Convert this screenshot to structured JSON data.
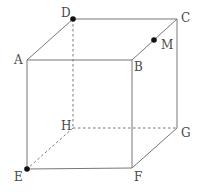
{
  "diagram": {
    "vertices": {
      "A": {
        "label": "A",
        "x": 27,
        "y": 60,
        "label_x": 14,
        "label_y": 64
      },
      "B": {
        "label": "B",
        "x": 132,
        "y": 60,
        "label_x": 134,
        "label_y": 71
      },
      "C": {
        "label": "C",
        "x": 177,
        "y": 19,
        "label_x": 181,
        "label_y": 22
      },
      "D": {
        "label": "D",
        "x": 73,
        "y": 19,
        "label_x": 61,
        "label_y": 17
      },
      "E": {
        "label": "E",
        "x": 27,
        "y": 169,
        "label_x": 14,
        "label_y": 181
      },
      "F": {
        "label": "F",
        "x": 132,
        "y": 168,
        "label_x": 134,
        "label_y": 181
      },
      "G": {
        "label": "G",
        "x": 177,
        "y": 128,
        "label_x": 181,
        "label_y": 137
      },
      "H": {
        "label": "H",
        "x": 73,
        "y": 128,
        "label_x": 61,
        "label_y": 130
      },
      "M": {
        "label": "M",
        "x": 154,
        "y": 40,
        "label_x": 161,
        "label_y": 49
      }
    },
    "solid_edges": [
      "AB",
      "BC",
      "CD",
      "DA",
      "AE",
      "BF",
      "CG",
      "EF",
      "FG"
    ],
    "dashed_edges": [
      "DH",
      "HE",
      "HG"
    ],
    "highlighted_points": [
      "D",
      "M",
      "E"
    ],
    "colors": {
      "edge": "#777777",
      "point": "#111111",
      "label": "#4a4a4a"
    }
  }
}
